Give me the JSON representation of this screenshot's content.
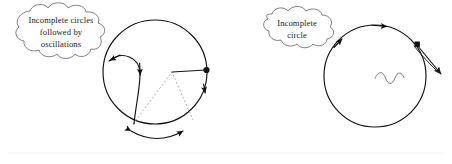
{
  "figure": {
    "background_color": "#ffffff",
    "ink_color": "#111111",
    "dash_color": "#9a9a9a",
    "width": 452,
    "height": 164
  },
  "panels": [
    {
      "id": "left-panel",
      "callout": {
        "lines": [
          "Incomplete circles",
          "followed by",
          "oscillations"
        ],
        "line1": "Incomplete circles",
        "line2": "followed by",
        "line3": "oscillations"
      },
      "circle": {
        "center_x": 155,
        "center_y": 72,
        "radius": 52
      },
      "markers": {
        "endpoint_dot": "filled-circle",
        "arrowheads": 5,
        "double_arrow_arc": "bidirectional"
      },
      "annotations": {
        "dashed_triangle": "dashed",
        "radius_line": "center-to-rim"
      }
    },
    {
      "id": "right-panel",
      "callout": {
        "lines": [
          "Incomplete",
          "circle"
        ],
        "line1": "Incomplete",
        "line2": "circle"
      },
      "circle": {
        "center_x": 375,
        "center_y": 76,
        "radius": 51
      },
      "markers": {
        "endpoint_dot": "filled-square",
        "arrowheads": 3,
        "tangent_exit_arrow": "outward"
      },
      "annotations": {
        "oscillation_squiggle": "sine-wave"
      }
    }
  ]
}
